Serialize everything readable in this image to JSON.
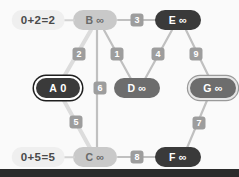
{
  "canvas": {
    "width": 239,
    "height": 177,
    "background": "#fafafa"
  },
  "palette": {
    "node_unvisited": "#c9c9c9",
    "node_frontier": "#6d6d6d",
    "node_far": "#3a3a3a",
    "edge": "#c0c0c0",
    "edge_highlight": "#dcdcdc",
    "weight_badge": "#9d9d9d",
    "callout_bg": "#efefef",
    "text_light": "#6a6a6a",
    "text_dark": "#ffffff"
  },
  "nodes": [
    {
      "id": "A",
      "name": "A",
      "dist": "0",
      "x": 58,
      "y": 88,
      "style": "dark",
      "ring": "ring-white",
      "w": 44
    },
    {
      "id": "B",
      "name": "B",
      "dist": "∞",
      "x": 95,
      "y": 20,
      "style": "light",
      "ring": "none",
      "w": 44
    },
    {
      "id": "C",
      "name": "C",
      "dist": "∞",
      "x": 95,
      "y": 157,
      "style": "light",
      "ring": "none",
      "w": 44
    },
    {
      "id": "D",
      "name": "D",
      "dist": "∞",
      "x": 137,
      "y": 88,
      "style": "mid",
      "ring": "none",
      "w": 46
    },
    {
      "id": "E",
      "name": "E",
      "dist": "∞",
      "x": 178,
      "y": 20,
      "style": "dark",
      "ring": "none",
      "w": 46
    },
    {
      "id": "F",
      "name": "F",
      "dist": "∞",
      "x": 178,
      "y": 157,
      "style": "dark",
      "ring": "none",
      "w": 46
    },
    {
      "id": "G",
      "name": "G",
      "dist": "∞",
      "x": 213,
      "y": 88,
      "style": "mid",
      "ring": "ring-light",
      "w": 46
    }
  ],
  "edges": [
    {
      "from": "A",
      "to": "B",
      "weight": "2",
      "lx": 79,
      "ly": 54,
      "highlight": true
    },
    {
      "from": "A",
      "to": "C",
      "weight": "5",
      "lx": 76,
      "ly": 122,
      "highlight": true
    },
    {
      "from": "B",
      "to": "D",
      "weight": "1",
      "lx": 117,
      "ly": 54,
      "highlight": false
    },
    {
      "from": "B",
      "to": "E",
      "weight": "3",
      "lx": 137,
      "ly": 20,
      "highlight": false
    },
    {
      "from": "B",
      "to": "C",
      "weight": "6",
      "lx": 100,
      "ly": 88,
      "highlight": false
    },
    {
      "from": "E",
      "to": "D",
      "weight": "4",
      "lx": 158,
      "ly": 54,
      "highlight": false
    },
    {
      "from": "E",
      "to": "G",
      "weight": "9",
      "lx": 196,
      "ly": 54,
      "highlight": false
    },
    {
      "from": "G",
      "to": "F",
      "weight": "7",
      "lx": 199,
      "ly": 123,
      "highlight": false
    },
    {
      "from": "C",
      "to": "F",
      "weight": "8",
      "lx": 137,
      "ly": 157,
      "highlight": false
    }
  ],
  "callouts": [
    {
      "id": "relax-b",
      "text": "0+2=2",
      "x": 38,
      "y": 20,
      "leader_x": 62,
      "leader_y": 20,
      "leader_w": 13
    },
    {
      "id": "relax-c",
      "text": "0+5=5",
      "x": 38,
      "y": 157,
      "leader_x": 62,
      "leader_y": 157,
      "leader_w": 13
    }
  ]
}
